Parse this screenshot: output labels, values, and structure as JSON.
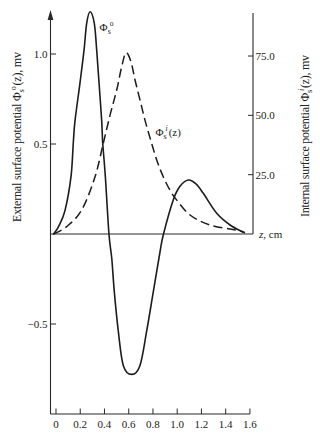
{
  "chart_data": {
    "type": "line",
    "title": "",
    "xlabel": "z, cm",
    "xlabel_parts": {
      "var": "z",
      "unit": ", cm"
    },
    "ylabel": "External surface potential Φs°(z), mv",
    "ylabel_parts": {
      "text": "External surface potential ",
      "symbol": "Φ",
      "sub": "s",
      "sup": "o",
      "tail": "(z), mv"
    },
    "y2label": "Internal surface potential Φsⁱ(z), mv",
    "y2label_parts": {
      "text": "Internal surface potential ",
      "symbol": "Φ",
      "sub": "s",
      "sup": "i",
      "tail": "(z), mv"
    },
    "xlim": [
      0,
      1.6
    ],
    "ylim": [
      -1.0,
      1.23
    ],
    "y2lim": [
      0,
      93
    ],
    "xticks": [
      0,
      0.2,
      0.4,
      0.6,
      0.8,
      1.0,
      1.2,
      1.4,
      1.6
    ],
    "xtick_labels": [
      "0",
      "0.2",
      "0.4",
      "0.6",
      "0.8",
      "1.0",
      "1.2",
      "1.4",
      "1.6"
    ],
    "yticks": [
      -0.5,
      0.5,
      1.0
    ],
    "ytick_labels": [
      "−0.5",
      "0.5",
      "1.0"
    ],
    "y2ticks": [
      25,
      50,
      75
    ],
    "y2tick_labels": [
      "25.0",
      "50.0",
      "75.0"
    ],
    "grid": false,
    "legend": null,
    "series": [
      {
        "name": "Φs° (external surface potential)",
        "axis": "left",
        "style": "solid",
        "unit": "mv",
        "points": [
          [
            -0.02,
            0.0
          ],
          [
            0.02,
            0.04
          ],
          [
            0.074,
            0.13
          ],
          [
            0.124,
            0.32
          ],
          [
            0.143,
            0.51
          ],
          [
            0.157,
            0.63
          ],
          [
            0.198,
            0.84
          ],
          [
            0.231,
            1.02
          ],
          [
            0.253,
            1.17
          ],
          [
            0.281,
            1.235
          ],
          [
            0.316,
            1.17
          ],
          [
            0.336,
            1.02
          ],
          [
            0.355,
            0.84
          ],
          [
            0.377,
            0.63
          ],
          [
            0.385,
            0.51
          ],
          [
            0.407,
            0.32
          ],
          [
            0.437,
            0.0
          ],
          [
            0.46,
            -0.135
          ],
          [
            0.481,
            -0.32
          ],
          [
            0.514,
            -0.54
          ],
          [
            0.555,
            -0.73
          ],
          [
            0.625,
            -0.78
          ],
          [
            0.693,
            -0.73
          ],
          [
            0.748,
            -0.54
          ],
          [
            0.803,
            -0.32
          ],
          [
            0.858,
            -0.1
          ],
          [
            0.887,
            0.0
          ],
          [
            0.968,
            0.19
          ],
          [
            1.023,
            0.265
          ],
          [
            1.092,
            0.3
          ],
          [
            1.155,
            0.278
          ],
          [
            1.215,
            0.226
          ],
          [
            1.326,
            0.115
          ],
          [
            1.436,
            0.05
          ],
          [
            1.545,
            0.01
          ]
        ]
      },
      {
        "name": "Φsⁱ(z) (internal surface potential)",
        "axis": "right",
        "style": "dashed",
        "unit": "mv",
        "points": [
          [
            -0.02,
            0.0
          ],
          [
            0.088,
            3.1
          ],
          [
            0.212,
            10.1
          ],
          [
            0.322,
            24.1
          ],
          [
            0.39,
            38.2
          ],
          [
            0.446,
            50.1
          ],
          [
            0.501,
            60.7
          ],
          [
            0.542,
            70.5
          ],
          [
            0.578,
            76.4
          ],
          [
            0.619,
            72.5
          ],
          [
            0.652,
            64.9
          ],
          [
            0.693,
            56.5
          ],
          [
            0.734,
            48.0
          ],
          [
            0.781,
            39.6
          ],
          [
            0.831,
            31.2
          ],
          [
            0.885,
            24.1
          ],
          [
            0.94,
            18.5
          ],
          [
            0.99,
            14.7
          ],
          [
            1.106,
            8.0
          ],
          [
            1.271,
            3.8
          ],
          [
            1.518,
            1.3
          ],
          [
            1.559,
            0.4
          ]
        ]
      }
    ],
    "annotations": [
      {
        "text": "Φs°",
        "symbol": "Φ",
        "sub": "s",
        "sup": "o",
        "tail": "",
        "z": 0.36,
        "value": 1.13,
        "axis": "left"
      },
      {
        "text": "Φsⁱ(z)",
        "symbol": "Φ",
        "sub": "s",
        "sup": "i",
        "tail": "(z)",
        "z": 0.82,
        "value": 41.3,
        "axis": "right"
      }
    ]
  }
}
